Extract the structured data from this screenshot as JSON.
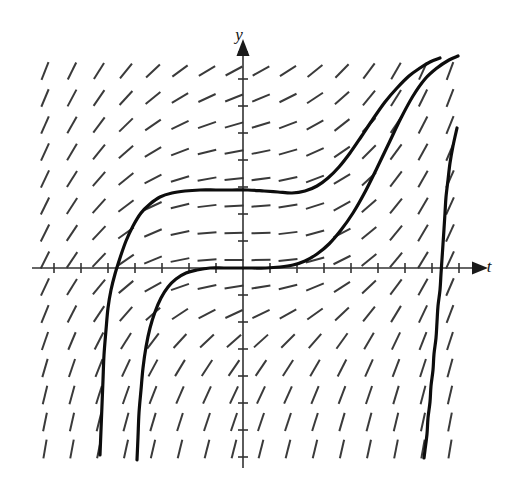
{
  "figure": {
    "kind": "slope-field-with-solution-curves",
    "title": "",
    "background": "#ffffff",
    "axis_color": "#333333",
    "slope_color": "#3a3a3a",
    "curve_color": "#0d0d0d"
  },
  "axes": {
    "x_label": "t",
    "y_label": "y",
    "x_label_pos": [
      489,
      272
    ],
    "y_label_pos": [
      239,
      40
    ],
    "origin_px": [
      243,
      268
    ],
    "x_axis_y_px": 268,
    "y_axis_x_px": 243,
    "x_axis_from_px": 32,
    "x_axis_to_px": 480,
    "y_axis_from_px": 48,
    "y_axis_to_px": 468,
    "tick_spacing_px": 27,
    "tick_half_len_px": 5,
    "show_tick_numbers": false
  },
  "chart_data": {
    "type": "line",
    "title": "",
    "xlabel": "t",
    "ylabel": "y",
    "xlim": [
      -7.8,
      8.8
    ],
    "ylim": [
      -7.3,
      8.0
    ],
    "grid": false,
    "legend": null,
    "slope_field": {
      "equation_label": "dy/dt = f(t, y)",
      "columns_px": [
        45,
        72,
        99,
        126,
        153,
        180,
        207,
        234,
        261,
        288,
        315,
        342,
        369,
        396,
        423,
        450
      ],
      "rows_px": [
        71,
        98,
        125,
        152,
        179,
        206,
        233,
        260,
        287,
        314,
        341,
        368,
        395,
        422,
        449
      ],
      "segment_len_px": 19,
      "angle_rule": "slope magnitude grows with horizontal distance from the y-axis and with downward distance below the axis; flat (horizontal) near the vertical centre band, steep (near vertical) at the far left, far right and along the bottom"
    },
    "series": [
      {
        "name": "solution-curve-upper",
        "note": "rises from lower-left asymptote, plateaus near y-plateau, then climbs steeply at the right",
        "points_px": [
          [
            100,
            455
          ],
          [
            101,
            430
          ],
          [
            102,
            405
          ],
          [
            103,
            380
          ],
          [
            104,
            355
          ],
          [
            106,
            330
          ],
          [
            108,
            308
          ],
          [
            111,
            290
          ],
          [
            115,
            274
          ],
          [
            120,
            258
          ],
          [
            126,
            241
          ],
          [
            133,
            226
          ],
          [
            141,
            213
          ],
          [
            150,
            204
          ],
          [
            160,
            197
          ],
          [
            172,
            193
          ],
          [
            185,
            191
          ],
          [
            200,
            190
          ],
          [
            216,
            190
          ],
          [
            232,
            190
          ],
          [
            248,
            190
          ],
          [
            264,
            191
          ],
          [
            278,
            192
          ],
          [
            292,
            193
          ],
          [
            305,
            191
          ],
          [
            317,
            186
          ],
          [
            328,
            178
          ],
          [
            339,
            167
          ],
          [
            350,
            153
          ],
          [
            361,
            137
          ],
          [
            373,
            119
          ],
          [
            385,
            102
          ],
          [
            397,
            88
          ],
          [
            409,
            76
          ],
          [
            420,
            68
          ],
          [
            430,
            62
          ],
          [
            440,
            58
          ]
        ]
      },
      {
        "name": "solution-curve-middle",
        "note": "rises from a lower-left asymptote, flattens through the origin, then climbs steeply on the right",
        "points_px": [
          [
            137,
            460
          ],
          [
            138,
            437
          ],
          [
            139,
            413
          ],
          [
            141,
            390
          ],
          [
            143,
            368
          ],
          [
            146,
            347
          ],
          [
            150,
            328
          ],
          [
            155,
            312
          ],
          [
            161,
            298
          ],
          [
            168,
            287
          ],
          [
            176,
            279
          ],
          [
            186,
            273
          ],
          [
            197,
            270
          ],
          [
            210,
            268
          ],
          [
            224,
            268
          ],
          [
            238,
            268
          ],
          [
            252,
            268
          ],
          [
            266,
            268
          ],
          [
            280,
            267
          ],
          [
            293,
            265
          ],
          [
            305,
            261
          ],
          [
            317,
            254
          ],
          [
            329,
            244
          ],
          [
            341,
            230
          ],
          [
            353,
            213
          ],
          [
            365,
            192
          ],
          [
            377,
            168
          ],
          [
            389,
            143
          ],
          [
            401,
            118
          ],
          [
            413,
            96
          ],
          [
            425,
            79
          ],
          [
            437,
            68
          ],
          [
            449,
            60
          ],
          [
            458,
            56
          ]
        ]
      },
      {
        "name": "solution-curve-right",
        "note": "descends from the upper right, crosses the t-axis near the right edge and falls to a vertical asymptote",
        "points_px": [
          [
            457,
            128
          ],
          [
            453,
            146
          ],
          [
            450,
            163
          ],
          [
            448,
            180
          ],
          [
            446,
            197
          ],
          [
            445,
            213
          ],
          [
            444,
            229
          ],
          [
            443,
            244
          ],
          [
            442,
            259
          ],
          [
            441,
            274
          ],
          [
            440,
            290
          ],
          [
            438,
            306
          ],
          [
            437,
            322
          ],
          [
            436,
            338
          ],
          [
            434,
            354
          ],
          [
            433,
            370
          ],
          [
            431,
            386
          ],
          [
            430,
            402
          ],
          [
            428,
            418
          ],
          [
            427,
            434
          ],
          [
            425,
            450
          ],
          [
            424,
            458
          ]
        ]
      }
    ]
  }
}
